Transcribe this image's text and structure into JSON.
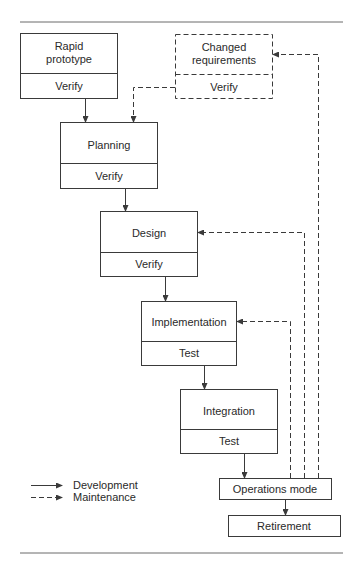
{
  "diagram": {
    "type": "rapid-prototyping-life-cycle-model",
    "nodes": [
      {
        "id": "rapid_prototype",
        "label_lines": [
          "Rapid",
          "prototype"
        ],
        "sub": "Verify",
        "style": "solid"
      },
      {
        "id": "changed_requirements",
        "label_lines": [
          "Changed",
          "requirements"
        ],
        "sub": "Verify",
        "style": "dashed"
      },
      {
        "id": "planning",
        "label_lines": [
          "Planning"
        ],
        "sub": "Verify",
        "style": "solid"
      },
      {
        "id": "design",
        "label_lines": [
          "Design"
        ],
        "sub": "Verify",
        "style": "solid"
      },
      {
        "id": "implementation",
        "label_lines": [
          "Implementation"
        ],
        "sub": "Test",
        "style": "solid"
      },
      {
        "id": "integration",
        "label_lines": [
          "Integration"
        ],
        "sub": "Test",
        "style": "solid"
      },
      {
        "id": "operations_mode",
        "label_lines": [
          "Operations mode"
        ],
        "style": "solid"
      },
      {
        "id": "retirement",
        "label_lines": [
          "Retirement"
        ],
        "style": "solid"
      }
    ],
    "edges": [
      {
        "from": "rapid_prototype",
        "to": "planning",
        "kind": "development"
      },
      {
        "from": "changed_requirements",
        "to": "planning",
        "kind": "maintenance"
      },
      {
        "from": "planning",
        "to": "design",
        "kind": "development"
      },
      {
        "from": "design",
        "to": "implementation",
        "kind": "development"
      },
      {
        "from": "implementation",
        "to": "integration",
        "kind": "development"
      },
      {
        "from": "integration",
        "to": "operations_mode",
        "kind": "development"
      },
      {
        "from": "operations_mode",
        "to": "retirement",
        "kind": "development"
      },
      {
        "from": "operations_mode",
        "to": "changed_requirements",
        "kind": "maintenance"
      },
      {
        "from": "operations_mode",
        "to": "design",
        "kind": "maintenance"
      },
      {
        "from": "operations_mode",
        "to": "implementation",
        "kind": "maintenance"
      }
    ]
  },
  "labels": {
    "rapid_1": "Rapid",
    "rapid_2": "prototype",
    "rapid_sub": "Verify",
    "changed_1": "Changed",
    "changed_2": "requirements",
    "changed_sub": "Verify",
    "planning": "Planning",
    "planning_sub": "Verify",
    "design": "Design",
    "design_sub": "Verify",
    "implementation": "Implementation",
    "implementation_sub": "Test",
    "integration": "Integration",
    "integration_sub": "Test",
    "operations": "Operations mode",
    "retirement": "Retirement"
  },
  "legend": {
    "development": "Development",
    "maintenance": "Maintenance"
  },
  "colors": {
    "stroke": "#3a3a3a",
    "text": "#2a2a2a",
    "background": "#ffffff"
  }
}
